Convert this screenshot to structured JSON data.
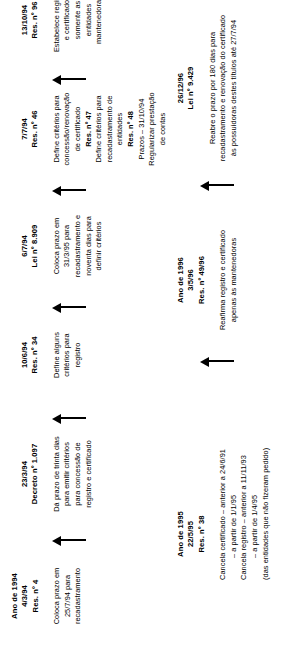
{
  "diagram": {
    "orientation": "rotated-90",
    "events": [
      {
        "id": "ev1",
        "year_label": "Ano de 1994",
        "date": "4/3/94",
        "norm": "Res. nº 4",
        "body": [
          {
            "text": "Coloca prazo em",
            "bold": false
          },
          {
            "text": "25/7/94 para",
            "bold": false
          },
          {
            "text": "recadastramento",
            "bold": false
          }
        ]
      },
      {
        "id": "ev2",
        "year_label": "",
        "date": "23/3/94",
        "norm": "Decreto nº 1.097",
        "body": [
          {
            "text": "Dá prazo de trinta dias",
            "bold": false
          },
          {
            "text": "para emitir critérios",
            "bold": false
          },
          {
            "text": "para concessão de",
            "bold": false
          },
          {
            "text": "registro e certificado",
            "bold": false
          }
        ]
      },
      {
        "id": "ev3",
        "year_label": "",
        "date": "10/6/94",
        "norm": "Res. nº 34",
        "body": [
          {
            "text": "Define alguns",
            "bold": false
          },
          {
            "text": "critérios para",
            "bold": false
          },
          {
            "text": "registro",
            "bold": false
          }
        ]
      },
      {
        "id": "ev4",
        "year_label": "",
        "date": "6/7/94",
        "norm": "Lei nº 8.909",
        "body": [
          {
            "text": "Coloca prazo em",
            "bold": false
          },
          {
            "text": "31/3/95 para",
            "bold": false
          },
          {
            "text": "recadastramento e",
            "bold": false
          },
          {
            "text": "noventa dias para",
            "bold": false
          },
          {
            "text": "definir critérios",
            "bold": false
          }
        ]
      },
      {
        "id": "ev5",
        "year_label": "",
        "date": "7/7/94",
        "norm": "Res. nº 46",
        "body": [
          {
            "text": "Define critérios para",
            "bold": false
          },
          {
            "text": "concessão/renovação",
            "bold": false
          },
          {
            "text": "de certificado",
            "bold": false
          },
          {
            "text": "Res. nº 47",
            "bold": true
          },
          {
            "text": "Define critérios para",
            "bold": false
          },
          {
            "text": "recadastramento de",
            "bold": false
          },
          {
            "text": "entidades",
            "bold": false
          },
          {
            "text": "Res. nº 48",
            "bold": true
          },
          {
            "text": "Prazos – 31/10/94",
            "bold": false
          },
          {
            "text": "Regularizar prestação",
            "bold": false
          },
          {
            "text": "de contas",
            "bold": false
          }
        ]
      },
      {
        "id": "ev6",
        "year_label": "",
        "date": "13/10/94",
        "norm": "Res. nº 96",
        "body": [
          {
            "text": "Estabelece registro",
            "bold": false
          },
          {
            "text": "e certificado",
            "bold": false
          },
          {
            "text": "somente as",
            "bold": false
          },
          {
            "text": "entidades",
            "bold": false
          },
          {
            "text": "mantenedoras",
            "bold": false
          }
        ]
      },
      {
        "id": "ev7",
        "year_label": "Ano de 1995",
        "date": "22/5/95",
        "norm": "Res. nº 38",
        "body": [
          {
            "text": "Cancela certificado – anterior a 24/6/91",
            "bold": false
          },
          {
            "text": "– a partir de  1/1/95",
            "bold": false
          },
          {
            "text": "Cancela registro – anterior a 11/11/93",
            "bold": false
          },
          {
            "text": "– a partir de 1/4/95",
            "bold": false
          },
          {
            "text": "(das entidades que não fizeram pedido)",
            "bold": false
          }
        ]
      },
      {
        "id": "ev8",
        "year_label": "Ano de 1996",
        "date": "3/5/96",
        "norm": "Res. nº 49/96",
        "body": [
          {
            "text": "Reafirma registro e certificado",
            "bold": false
          },
          {
            "text": "apenas às mantenedoras",
            "bold": false
          }
        ]
      },
      {
        "id": "ev9",
        "year_label": "",
        "date": "26/12/96",
        "norm": "Lei nº 9.429",
        "body": [
          {
            "text": "Reabre o prazo por 180 dias para",
            "bold": false
          },
          {
            "text": "recadastramento e renovação do certificado",
            "bold": false
          },
          {
            "text": "às possuidoras destes títulos até 27/7/94",
            "bold": false
          }
        ]
      }
    ],
    "connectors": [
      {
        "id": "arrow-1",
        "from": "ev1",
        "to": "ev2"
      },
      {
        "id": "arrow-2",
        "from": "ev2",
        "to": "ev3"
      },
      {
        "id": "arrow-3",
        "from": "ev3",
        "to": "ev4"
      },
      {
        "id": "arrow-4",
        "from": "ev4",
        "to": "ev5"
      },
      {
        "id": "arrow-5",
        "from": "ev5",
        "to": "ev6"
      },
      {
        "id": "arrow-6",
        "from": "ev7",
        "to": "ev8"
      },
      {
        "id": "arrow-7",
        "from": "ev8",
        "to": "ev9"
      }
    ],
    "colors": {
      "ink": "#000000",
      "paper": "#ffffff"
    }
  }
}
